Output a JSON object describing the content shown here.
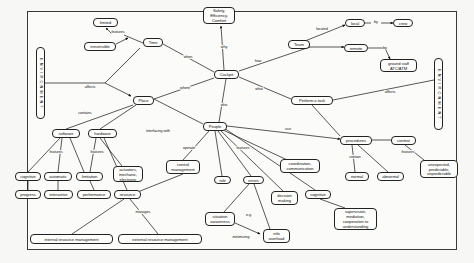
{
  "diagram": {
    "frame": {
      "border_color": "#3a3a3a",
      "background": "#fbfbf9"
    },
    "nodes": [
      {
        "id": "environment_left",
        "label": "E N V I R O N M E N T",
        "x": 36,
        "y": 47,
        "w": 9,
        "h": 72,
        "shape": "vertical-label"
      },
      {
        "id": "environment_right",
        "label": "E N V I R O N M E N T",
        "x": 434,
        "y": 58,
        "w": 9,
        "h": 72,
        "shape": "vertical-label"
      },
      {
        "id": "limited",
        "label": "limited",
        "x": 93,
        "y": 18,
        "w": 25,
        "h": 9
      },
      {
        "id": "irreversible",
        "label": "irreversible",
        "x": 84,
        "y": 42,
        "w": 32,
        "h": 9
      },
      {
        "id": "time",
        "label": "Time",
        "x": 143,
        "y": 38,
        "w": 20,
        "h": 9
      },
      {
        "id": "place",
        "label": "Place",
        "x": 133,
        "y": 96,
        "w": 21,
        "h": 9
      },
      {
        "id": "cockpit",
        "label": "Cockpit",
        "x": 214,
        "y": 70,
        "w": 25,
        "h": 9
      },
      {
        "id": "safety",
        "label": "Safety,\nEfficiency,\nComfort",
        "x": 203,
        "y": 7,
        "w": 32,
        "h": 17
      },
      {
        "id": "team",
        "label": "Team",
        "x": 288,
        "y": 40,
        "w": 22,
        "h": 9
      },
      {
        "id": "local",
        "label": "local",
        "x": 345,
        "y": 19,
        "w": 20,
        "h": 8
      },
      {
        "id": "remote",
        "label": "remote",
        "x": 344,
        "y": 44,
        "w": 24,
        "h": 8
      },
      {
        "id": "crew",
        "label": "crew",
        "x": 393,
        "y": 19,
        "w": 20,
        "h": 8
      },
      {
        "id": "ground_staff",
        "label": "ground staff\nATC/ATM",
        "x": 380,
        "y": 59,
        "w": 37,
        "h": 13
      },
      {
        "id": "perform_task",
        "label": "Perform a task",
        "x": 291,
        "y": 96,
        "w": 42,
        "h": 9
      },
      {
        "id": "people",
        "label": "People",
        "x": 203,
        "y": 122,
        "w": 24,
        "h": 9
      },
      {
        "id": "software",
        "label": "software",
        "x": 52,
        "y": 129,
        "w": 28,
        "h": 9
      },
      {
        "id": "hardware",
        "label": "hardware",
        "x": 88,
        "y": 129,
        "w": 29,
        "h": 9
      },
      {
        "id": "cognitive_sw",
        "label": "cognitive",
        "x": 15,
        "y": 172,
        "w": 26,
        "h": 9
      },
      {
        "id": "automatic",
        "label": "automatic",
        "x": 44,
        "y": 172,
        "w": 28,
        "h": 9
      },
      {
        "id": "limitation",
        "label": "limitation",
        "x": 76,
        "y": 172,
        "w": 27,
        "h": 9
      },
      {
        "id": "progress",
        "label": "progress",
        "x": 15,
        "y": 190,
        "w": 26,
        "h": 9
      },
      {
        "id": "interactive",
        "label": "interactive",
        "x": 44,
        "y": 190,
        "w": 29,
        "h": 9
      },
      {
        "id": "performance",
        "label": "performance",
        "x": 77,
        "y": 190,
        "w": 34,
        "h": 9
      },
      {
        "id": "actuators",
        "label": "actuators,\nmechanic,\nelectronic",
        "x": 113,
        "y": 166,
        "w": 30,
        "h": 16
      },
      {
        "id": "resource",
        "label": "resource",
        "x": 114,
        "y": 190,
        "w": 27,
        "h": 9
      },
      {
        "id": "internal_rm",
        "label": "internal resource management",
        "x": 30,
        "y": 234,
        "w": 83,
        "h": 10
      },
      {
        "id": "external_rm",
        "label": "external resource management",
        "x": 118,
        "y": 234,
        "w": 84,
        "h": 10
      },
      {
        "id": "control_mgmt",
        "label": "control\nmanagement",
        "x": 166,
        "y": 160,
        "w": 34,
        "h": 14
      },
      {
        "id": "role",
        "label": "role",
        "x": 214,
        "y": 176,
        "w": 17,
        "h": 8
      },
      {
        "id": "errors",
        "label": "errors",
        "x": 243,
        "y": 176,
        "w": 21,
        "h": 8
      },
      {
        "id": "situation_aware",
        "label": "situation\nawareness",
        "x": 205,
        "y": 212,
        "w": 30,
        "h": 14
      },
      {
        "id": "info_overload",
        "label": "info\noverload",
        "x": 263,
        "y": 229,
        "w": 27,
        "h": 14
      },
      {
        "id": "decision_making",
        "label": "decision\nmaking",
        "x": 271,
        "y": 191,
        "w": 27,
        "h": 14
      },
      {
        "id": "coordination",
        "label": "coordination,\ncommunication",
        "x": 280,
        "y": 159,
        "w": 40,
        "h": 14
      },
      {
        "id": "cognitive_people",
        "label": "cognitive",
        "x": 305,
        "y": 190,
        "w": 26,
        "h": 9
      },
      {
        "id": "supervision",
        "label": "supervision,\nmediation,\ncooperation to\nunderstanding",
        "x": 334,
        "y": 208,
        "w": 43,
        "h": 22
      },
      {
        "id": "procedures",
        "label": "procedures",
        "x": 340,
        "y": 136,
        "w": 32,
        "h": 9
      },
      {
        "id": "context",
        "label": "context",
        "x": 391,
        "y": 136,
        "w": 25,
        "h": 9
      },
      {
        "id": "normal",
        "label": "normal",
        "x": 345,
        "y": 172,
        "w": 24,
        "h": 9
      },
      {
        "id": "abnormal",
        "label": "abnormal",
        "x": 377,
        "y": 172,
        "w": 27,
        "h": 9
      },
      {
        "id": "unexpected",
        "label": "unexpected,\npredictable,\nunpredictable",
        "x": 420,
        "y": 160,
        "w": 38,
        "h": 18
      }
    ],
    "edge_labels": [
      {
        "id": "features_time",
        "label": "features",
        "x": 118,
        "y": 32
      },
      {
        "id": "when",
        "label": "when",
        "x": 188,
        "y": 57
      },
      {
        "id": "how",
        "label": "how",
        "x": 258,
        "y": 61
      },
      {
        "id": "where",
        "label": "where",
        "x": 185,
        "y": 88
      },
      {
        "id": "what",
        "label": "what",
        "x": 259,
        "y": 89
      },
      {
        "id": "who",
        "label": "who",
        "x": 224,
        "y": 105
      },
      {
        "id": "why",
        "label": "why",
        "x": 224,
        "y": 47
      },
      {
        "id": "located",
        "label": "located",
        "x": 322,
        "y": 29
      },
      {
        "id": "by_crew",
        "label": "by",
        "x": 376,
        "y": 22
      },
      {
        "id": "by_ground",
        "label": "by",
        "x": 385,
        "y": 48
      },
      {
        "id": "affects_left",
        "label": "affects",
        "x": 90,
        "y": 87
      },
      {
        "id": "affects_right",
        "label": "affects",
        "x": 390,
        "y": 92
      },
      {
        "id": "contains",
        "label": "contains",
        "x": 85,
        "y": 113
      },
      {
        "id": "features_sw",
        "label": "features",
        "x": 56,
        "y": 152
      },
      {
        "id": "features_hw",
        "label": "features",
        "x": 97,
        "y": 152
      },
      {
        "id": "interfacing",
        "label": "interfacing with",
        "x": 158,
        "y": 131
      },
      {
        "id": "manages",
        "label": "manages",
        "x": 143,
        "y": 212
      },
      {
        "id": "operate",
        "label": "operate",
        "x": 189,
        "y": 148
      },
      {
        "id": "features_people",
        "label": "features",
        "x": 243,
        "y": 148
      },
      {
        "id": "use",
        "label": "use",
        "x": 288,
        "y": 129
      },
      {
        "id": "contain",
        "label": "contain",
        "x": 355,
        "y": 157
      },
      {
        "id": "features_context",
        "label": "features",
        "x": 408,
        "y": 152
      },
      {
        "id": "eg",
        "label": "e.g.",
        "x": 249,
        "y": 215
      },
      {
        "id": "minimizing",
        "label": "minimizing",
        "x": 241,
        "y": 237
      }
    ]
  }
}
